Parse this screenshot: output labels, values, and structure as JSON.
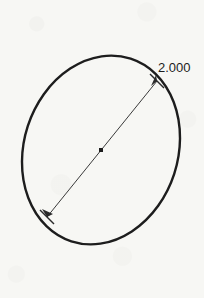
{
  "canvas": {
    "width": 204,
    "height": 298,
    "background_color": "#f7f7f4"
  },
  "drawing": {
    "title": "ellipse-with-diameter-dimension",
    "stroke_color": "#1d1d1d",
    "dimension_color": "#3a3a3a",
    "ellipse": {
      "center_x": 101,
      "center_y": 150,
      "radius_x": 77,
      "radius_y": 96,
      "rotation_deg": 18,
      "stroke_width": 2.4
    },
    "dimension_line": {
      "x1": 47,
      "y1": 217,
      "x2": 157,
      "y2": 81,
      "stroke_width": 1
    },
    "center_marker": {
      "x": 101,
      "y": 150,
      "size": 4
    },
    "label": {
      "text": "2.000",
      "x": 158,
      "y": 69
    },
    "endpoint_ticks": [
      {
        "name": "lower-left-tick",
        "x": 47,
        "y": 217,
        "angle_deg": -51
      },
      {
        "name": "upper-right-tick",
        "x": 157,
        "y": 81,
        "angle_deg": -51
      }
    ]
  }
}
